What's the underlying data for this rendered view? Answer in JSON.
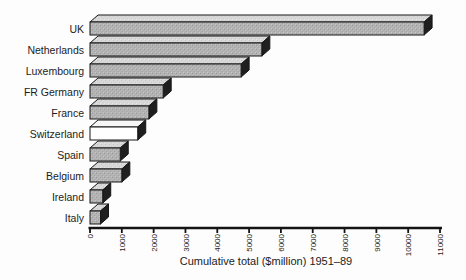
{
  "chart_data": {
    "type": "bar",
    "orientation": "horizontal",
    "style": "3d-block-bars-scanned-print",
    "title": "",
    "xlabel": "Cumulative total ($million) 1951–89",
    "categories": [
      "UK",
      "Netherlands",
      "Luxembourg",
      "FR Germany",
      "France",
      "Switzerland",
      "Spain",
      "Belgium",
      "Ireland",
      "Italy"
    ],
    "values": [
      10500,
      5400,
      4750,
      2300,
      1850,
      1500,
      950,
      1000,
      400,
      330
    ],
    "xlim": [
      0,
      11000
    ],
    "xticks": [
      0,
      1000,
      2000,
      3000,
      4000,
      5000,
      6000,
      7000,
      8000,
      9000,
      10000,
      11000
    ],
    "xtick_label_rotation_deg": -90,
    "grid": "off",
    "legend": "none",
    "highlighted_category": "Switzerland"
  },
  "colors": {
    "background": "#fdfdfd",
    "bar_front": "#b3b3b3",
    "bar_top": "#d8d8d8",
    "bar_side": "#1f1f1f",
    "highlight_front": "#ffffff",
    "highlight_top": "#f7f7f7",
    "outline": "#161616",
    "axis": "#141414",
    "text": "#1c1c1c"
  }
}
